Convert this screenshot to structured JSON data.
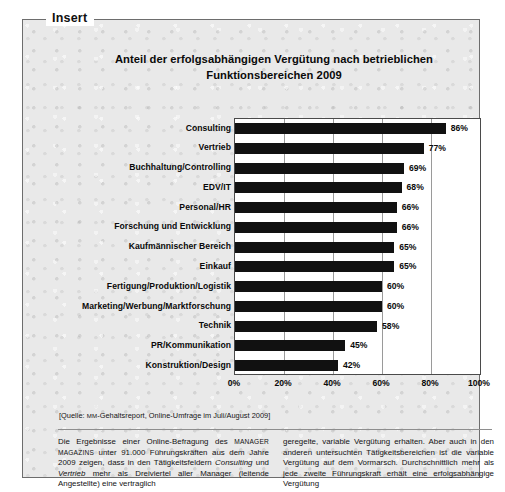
{
  "frame": {
    "legend_label": "Insert"
  },
  "chart_data": {
    "type": "bar",
    "orientation": "horizontal",
    "title": "Anteil der erfolgsabhängigen Vergütung nach betrieblichen Funktionsbereichen 2009",
    "title_line1": "Anteil der erfolgsabhängigen Vergütung nach betrieblichen",
    "title_line2": "Funktionsbereichen 2009",
    "xlabel": "",
    "ylabel": "",
    "xlim": [
      0,
      100
    ],
    "xticks": [
      "0%",
      "20%",
      "40%",
      "60%",
      "80%",
      "100%"
    ],
    "xtick_values": [
      0,
      20,
      40,
      60,
      80,
      100
    ],
    "grid": true,
    "legend": "none",
    "bar_color": "#111111",
    "categories": [
      "Consulting",
      "Vertrieb",
      "Buchhaltung/Controlling",
      "EDV/IT",
      "Personal/HR",
      "Forschung und Entwicklung",
      "Kaufmännischer Bereich",
      "Einkauf",
      "Fertigung/Produktion/Logistik",
      "Marketing/Werbung/Marktforschung",
      "Technik",
      "PR/Kommunikation",
      "Konstruktion/Design"
    ],
    "values": [
      86,
      77,
      69,
      68,
      66,
      66,
      65,
      65,
      60,
      60,
      58,
      45,
      42
    ],
    "value_labels": [
      "86%",
      "77%",
      "69%",
      "68%",
      "66%",
      "66%",
      "65%",
      "65%",
      "60%",
      "60%",
      "58%",
      "45%",
      "42%"
    ]
  },
  "source": {
    "prefix": "[Quelle: ",
    "publication": "MM",
    "rest": "-Gehaltsreport, Online-Umfrage im Juli/August 2009]"
  },
  "body_text": {
    "left_col_part1": "Die Ergebnisse einer Online-Befragung des ",
    "left_col_caps": "Manager Magazins",
    "left_col_part2": " unter 91.000 Führungskräften aus dem Jahre 2009 zeigen, dass in den Tätigkeitsfeldern ",
    "left_col_italic1": "Consulting",
    "left_col_part3": " und ",
    "left_col_italic2": "Vertrieb",
    "left_col_part4": " mehr als Dreiviertel aller Manager (leitende Angestellte) eine vertraglich",
    "right_col": "geregelte, variable Vergütung erhalten. Aber auch in den anderen untersuchten Tätigkeitsbereichen ist die variable Vergütung auf dem Vormarsch. Durchschnittlich mehr als jede zweite Führungskraft erhält eine erfolgsabhängige Vergütung"
  }
}
